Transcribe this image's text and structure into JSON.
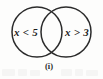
{
  "figure": {
    "type": "venn-diagram",
    "caption": "(i)",
    "background_color": "#fdfdfc",
    "stroke_color": "#2b2b2b",
    "text_color": "#1d1d1d",
    "sets": [
      {
        "id": "left",
        "label": "x < 5",
        "center_x": 37,
        "center_y": 32,
        "radius": 25
      },
      {
        "id": "right",
        "label": "x > 3",
        "center_x": 66,
        "center_y": 32,
        "radius": 25
      }
    ],
    "intersection": {
      "label": "",
      "shaded": false
    }
  }
}
